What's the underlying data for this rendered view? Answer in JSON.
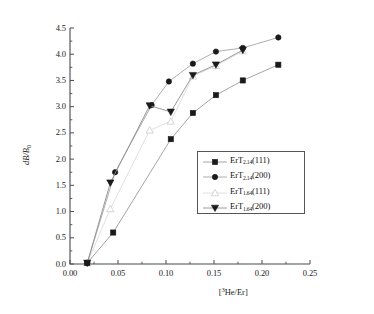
{
  "chart_data": {
    "type": "line",
    "title": "",
    "xlabel": "[3He/Er]",
    "xlabel_base": "[",
    "xlabel_sup": "3",
    "xlabel_rest": "He/Er]",
    "ylabel": "dB/B0",
    "ylabel_base": "dB/B",
    "ylabel_sub": "0",
    "xlim": [
      0.0,
      0.25
    ],
    "ylim": [
      0.0,
      4.5
    ],
    "xticks": [
      "0.00",
      "0.05",
      "0.10",
      "0.15",
      "0.20",
      "0.25"
    ],
    "xtick_values": [
      0.0,
      0.05,
      0.1,
      0.15,
      0.2,
      0.25
    ],
    "yticks": [
      "0.0",
      "0.5",
      "1.0",
      "1.5",
      "2.0",
      "2.5",
      "3.0",
      "3.5",
      "4.0",
      "4.5"
    ],
    "ytick_values": [
      0.0,
      0.5,
      1.0,
      1.5,
      2.0,
      2.5,
      3.0,
      3.5,
      4.0,
      4.5
    ],
    "grid": false,
    "legend_position": "lower-right-inside",
    "minor_ticks": true,
    "series": [
      {
        "name": "ErT2.14(111)",
        "label_base": "ErT",
        "label_sub": "2.14",
        "label_rest": "(111)",
        "marker": "square-filled",
        "color": "#1a1a1a",
        "line_color": "#9a9a9a",
        "x": [
          0.018,
          0.045,
          0.105,
          0.128,
          0.152,
          0.18,
          0.217
        ],
        "y": [
          0.02,
          0.6,
          2.38,
          2.88,
          3.22,
          3.5,
          3.8
        ]
      },
      {
        "name": "ErT2.14(200)",
        "label_base": "ErT",
        "label_sub": "2.14",
        "label_rest": "(200)",
        "marker": "circle-filled",
        "color": "#1a1a1a",
        "line_color": "#a5a5a5",
        "x": [
          0.018,
          0.047,
          0.085,
          0.103,
          0.128,
          0.152,
          0.18,
          0.217
        ],
        "y": [
          0.02,
          1.75,
          3.03,
          3.48,
          3.82,
          4.05,
          4.12,
          4.32
        ]
      },
      {
        "name": "ErT1.64(111)",
        "label_base": "ErT",
        "label_sub": "1.64",
        "label_rest": "(111)",
        "marker": "triangle-up-open",
        "color": "#cfcfcf",
        "line_color": "#dddddd",
        "x": [
          0.018,
          0.042,
          0.083,
          0.105,
          0.128,
          0.152,
          0.18
        ],
        "y": [
          0.02,
          1.05,
          2.55,
          2.72,
          3.58,
          3.78,
          4.06
        ]
      },
      {
        "name": "ErT1.64(200)",
        "label_base": "ErT",
        "label_sub": "1.64",
        "label_rest": "(200)",
        "marker": "triangle-down-filled",
        "color": "#1a1a1a",
        "line_color": "#8f8f8f",
        "x": [
          0.018,
          0.042,
          0.083,
          0.105,
          0.128,
          0.152,
          0.18
        ],
        "y": [
          0.02,
          1.55,
          3.02,
          2.9,
          3.6,
          3.8,
          4.08
        ]
      }
    ]
  },
  "axes": {
    "left_px": 70,
    "right_px": 310,
    "top_px": 28,
    "bottom_px": 264,
    "spine_color": "#4a4a4a"
  }
}
